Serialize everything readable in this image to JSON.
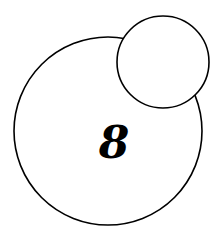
{
  "diagram": {
    "large_circle": {
      "cx": 108,
      "cy": 131,
      "r": 94,
      "label": "8"
    },
    "small_circle": {
      "cx": 163,
      "cy": 62,
      "r": 46,
      "label": ""
    },
    "stroke_color": "#000000",
    "background": "#ffffff"
  }
}
